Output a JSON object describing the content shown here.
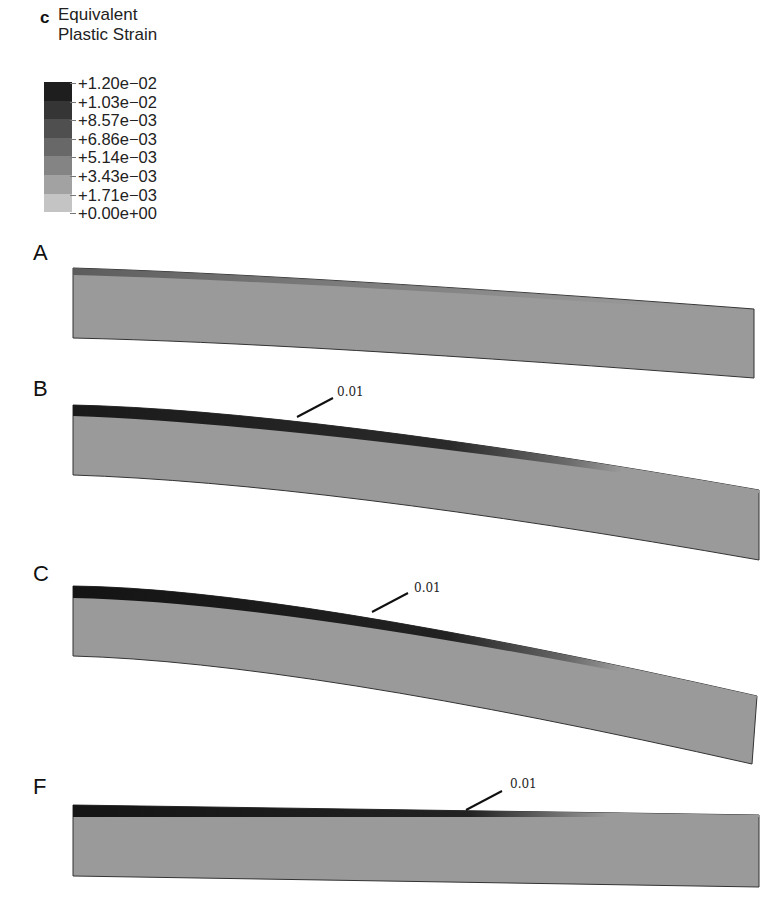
{
  "figure": {
    "panel_letter": "c",
    "legend": {
      "title_line1": "Equivalent",
      "title_line2": "Plastic Strain",
      "labels": [
        "+1.20e−02",
        "+1.03e−02",
        "+8.57e−03",
        "+6.86e−03",
        "+5.14e−03",
        "+3.43e−03",
        "+1.71e−03",
        "+0.00e+00"
      ],
      "band_colors": [
        "#1e1e1e",
        "#353535",
        "#4f4f4f",
        "#686868",
        "#848484",
        "#a2a2a2",
        "#c4c4c4"
      ]
    },
    "beams": [
      {
        "label": "A",
        "callout": ""
      },
      {
        "label": "B",
        "callout": "0.01"
      },
      {
        "label": "C",
        "callout": "0.01"
      },
      {
        "label": "F",
        "callout": "0.01"
      }
    ],
    "colors": {
      "beam_fill": "#9a9a9a",
      "high_strain": "#1a1a1a",
      "outline": "#333333"
    }
  }
}
